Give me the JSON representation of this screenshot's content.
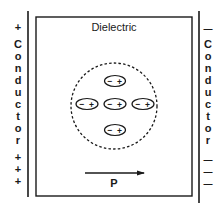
{
  "diagram": {
    "dielectric_label": "Dielectric",
    "polarization_label": "P",
    "left_conductor": {
      "top_sign": "+",
      "letters": [
        "C",
        "o",
        "n",
        "d",
        "u",
        "c",
        "t",
        "o",
        "r"
      ],
      "bottom_signs": [
        "+",
        "+",
        "+"
      ]
    },
    "right_conductor": {
      "top_sign": "—",
      "letters": [
        "C",
        "o",
        "n",
        "d",
        "u",
        "c",
        "t",
        "o",
        "r"
      ],
      "bottom_signs": [
        "—",
        "—",
        "—"
      ]
    },
    "molecules": [
      {
        "position": "top",
        "neg": "−",
        "pos": "+"
      },
      {
        "position": "middle-left",
        "neg": "−",
        "pos": "+"
      },
      {
        "position": "center",
        "neg": "−",
        "pos": "+"
      },
      {
        "position": "middle-right",
        "neg": "−",
        "pos": "+"
      },
      {
        "position": "bottom",
        "neg": "−",
        "pos": "+"
      }
    ],
    "colors": {
      "ink": "#1a1a1a",
      "background": "#ffffff"
    }
  }
}
